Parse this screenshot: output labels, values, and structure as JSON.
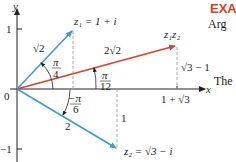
{
  "figure": {
    "axes": {
      "x_label": "x",
      "y_label": "y",
      "origin_label": "0",
      "y_tick_pos": "1",
      "y_tick_neg": "−1"
    },
    "vectors": {
      "z1": {
        "label": "z₁ = 1 + i",
        "length_label": "√2",
        "angle_label_num": "π",
        "angle_label_den": "4",
        "color": "#3a9bd5"
      },
      "z2": {
        "label": "z₂ = √3 − i",
        "length_label": "2",
        "angle_label_num": "−π",
        "angle_label_den": "6",
        "color": "#3a9bd5"
      },
      "z1z2": {
        "label": "z₁z₂",
        "length_label": "2√2",
        "angle_label_num": "π",
        "angle_label_den": "12",
        "color": "#d9412b"
      }
    },
    "annotations": {
      "z1z2_height": "√3 − 1",
      "z1z2_x": "1 + √3",
      "z2_depth": "1"
    }
  },
  "side_text": {
    "heading": "EXA",
    "line1": "Arg",
    "line2": "The"
  },
  "colors": {
    "blue": "#3a9bd5",
    "red": "#d9412b",
    "axis": "#231f20",
    "dashed": "#a9a9a9",
    "heading": "#d9411e"
  }
}
